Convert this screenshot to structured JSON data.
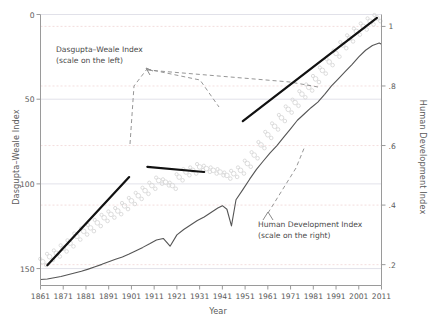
{
  "chart_data": {
    "type": "line",
    "title": "",
    "subtitle": "",
    "xlabel": "Year",
    "ylabel_left": "Dasgupta–Weale Index",
    "ylabel_right": "Human Development Index",
    "xlim": [
      1861,
      2011
    ],
    "ylim_left": [
      160,
      0
    ],
    "ylim_right": [
      0.13,
      1.04
    ],
    "y_left_inverted": true,
    "grid": true,
    "grid_left_ticks": [
      0,
      50,
      100,
      150
    ],
    "grid_right_ticks": [
      1,
      0.8,
      0.6,
      0.4,
      0.2
    ],
    "legend": "none",
    "annotations": [
      {
        "id": "dasgupta-weale-note",
        "line1": "Dasgupta–Weale Index",
        "line2": "(scale on the left)",
        "x": 56,
        "y": 45
      },
      {
        "id": "human-development-note",
        "line1": "Human Development Index",
        "line2": "(scale on the right)",
        "x": 258,
        "y": 220
      }
    ],
    "xticks": [
      1861,
      1871,
      1881,
      1891,
      1901,
      1911,
      1921,
      1931,
      1941,
      1951,
      1961,
      1971,
      1981,
      1991,
      2001,
      2011
    ],
    "xtick_labels": [
      "1861",
      "1871",
      "1881",
      "1891",
      "1901",
      "1911",
      "1921",
      "1931",
      "1941",
      "1951",
      "1961",
      "1971",
      "1981",
      "1991",
      "2001",
      "2011"
    ],
    "yticks_left": [
      0,
      50,
      100,
      150
    ],
    "ytick_labels_left": [
      "0",
      "50",
      "100",
      "150"
    ],
    "yticks_right": [
      1,
      0.8,
      0.6,
      0.4,
      0.2
    ],
    "ytick_labels_right": [
      "1",
      ".8",
      ".6",
      ".4",
      ".2"
    ],
    "colors": {
      "hdi_line": "#555555",
      "trend_line": "#111111",
      "scatter_marker": "#d8d8d8",
      "gridline_major": "#d9d9e3",
      "gridline_dashed": "#f0d5d5",
      "axis": "#9a9a9a",
      "text": "#4a4a4a"
    },
    "series": [
      {
        "name": "Human Development Index",
        "axis": "right",
        "style": "solid-thin",
        "x": [
          1861,
          1864,
          1867,
          1870,
          1873,
          1876,
          1879,
          1882,
          1885,
          1888,
          1891,
          1894,
          1897,
          1900,
          1903,
          1906,
          1909,
          1912,
          1915,
          1918,
          1921,
          1924,
          1927,
          1930,
          1933,
          1936,
          1939,
          1941,
          1943,
          1945,
          1947,
          1950,
          1953,
          1956,
          1959,
          1962,
          1965,
          1968,
          1971,
          1974,
          1977,
          1980,
          1983,
          1986,
          1989,
          1992,
          1995,
          1998,
          2001,
          2004,
          2007,
          2010,
          2011
        ],
        "values": [
          0.15,
          0.152,
          0.156,
          0.16,
          0.166,
          0.172,
          0.178,
          0.185,
          0.193,
          0.201,
          0.21,
          0.218,
          0.226,
          0.236,
          0.247,
          0.258,
          0.27,
          0.283,
          0.288,
          0.262,
          0.3,
          0.318,
          0.333,
          0.348,
          0.36,
          0.375,
          0.39,
          0.398,
          0.386,
          0.33,
          0.418,
          0.452,
          0.487,
          0.52,
          0.548,
          0.575,
          0.6,
          0.628,
          0.656,
          0.685,
          0.706,
          0.727,
          0.746,
          0.772,
          0.8,
          0.824,
          0.848,
          0.872,
          0.898,
          0.92,
          0.936,
          0.944,
          0.94
        ]
      },
      {
        "name": "Dasgupta–Weale Index (observations)",
        "axis": "left",
        "style": "scatter-faint",
        "x": [
          1862,
          1865,
          1868,
          1871,
          1874,
          1877,
          1880,
          1883,
          1886,
          1889,
          1892,
          1895,
          1898,
          1901,
          1904,
          1907,
          1910,
          1913,
          1916,
          1919,
          1922,
          1925,
          1928,
          1931,
          1934,
          1937,
          1940,
          1943,
          1946,
          1949,
          1952,
          1955,
          1958,
          1961,
          1964,
          1967,
          1970,
          1973,
          1976,
          1979,
          1982,
          1985,
          1988,
          1991,
          1994,
          1997,
          2000,
          2003,
          2006,
          2009
        ],
        "values": [
          146,
          143,
          141,
          138,
          135,
          131,
          128,
          126,
          123,
          120,
          118,
          116,
          113,
          110,
          107,
          104,
          101,
          98,
          99,
          101,
          96,
          93,
          92,
          90,
          91,
          92,
          93,
          95,
          94,
          92,
          88,
          83,
          77,
          71,
          66,
          61,
          56,
          52,
          47,
          43,
          38,
          33,
          28,
          23,
          18,
          14,
          10,
          7,
          4,
          2
        ]
      },
      {
        "name": "Dasgupta–Weale trend segment 1",
        "axis": "left",
        "style": "solid-bold",
        "x": [
          1864,
          1900
        ],
        "values": [
          148,
          96
        ]
      },
      {
        "name": "Dasgupta–Weale trend segment 2",
        "axis": "left",
        "style": "solid-bold",
        "x": [
          1908,
          1933
        ],
        "values": [
          90,
          93
        ]
      },
      {
        "name": "Dasgupta–Weale trend segment 3",
        "axis": "left",
        "style": "solid-bold",
        "x": [
          1950,
          2009
        ],
        "values": [
          63,
          2
        ]
      }
    ]
  }
}
